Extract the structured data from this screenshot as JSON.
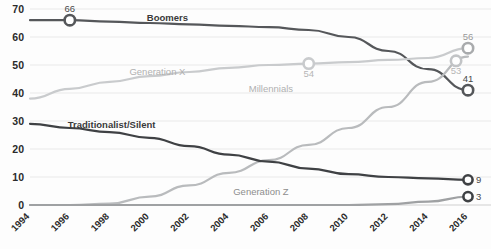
{
  "chart_data": {
    "type": "line",
    "title": "",
    "xlabel": "",
    "ylabel": "",
    "xlim": [
      1994,
      2016
    ],
    "ylim": [
      0,
      70
    ],
    "grid": true,
    "legend": "inline-labels",
    "x": [
      1994,
      1996,
      1998,
      2000,
      2002,
      2004,
      2006,
      2008,
      2010,
      2012,
      2014,
      2016
    ],
    "yticks": [
      "0",
      "10",
      "20",
      "30",
      "40",
      "50",
      "60",
      "70"
    ],
    "xticks": [
      "1994",
      "1996",
      "1998",
      "2000",
      "2002",
      "2004",
      "2006",
      "2008",
      "2010",
      "2012",
      "2014",
      "2016"
    ],
    "series": [
      {
        "name": "Boomers",
        "color": "#55575a",
        "label_x": 2000.9,
        "label_y": 65.6,
        "values": [
          66,
          66,
          65.5,
          65,
          64.5,
          64,
          63.5,
          62.5,
          60,
          55,
          48.5,
          41
        ]
      },
      {
        "name": "Generation X",
        "color": "#c9cbcd",
        "label_x": 2000.4,
        "label_y": 46.5,
        "values": [
          38,
          41.5,
          44,
          46,
          47.5,
          49,
          50,
          50.5,
          51,
          51.8,
          52.5,
          56
        ]
      },
      {
        "name": "Millennials",
        "color": "#b9bbbd",
        "label_x": 2006.1,
        "label_y": 40.5,
        "values": [
          0,
          0,
          0.5,
          3,
          7,
          11.5,
          16,
          21.5,
          27.5,
          35,
          44,
          53
        ]
      },
      {
        "name": "Traditionalist/Silent",
        "color": "#3f4144",
        "label_x": 1998.1,
        "label_y": 27.5,
        "values": [
          29,
          27.5,
          26,
          24,
          21,
          18,
          15.5,
          13,
          11,
          10,
          9.5,
          9
        ]
      },
      {
        "name": "Generation Z",
        "color": "#9fa1a3",
        "label_x": 2005.6,
        "label_y": 3.6,
        "values": [
          0,
          0,
          0,
          0,
          0,
          0,
          0,
          0,
          0,
          0.3,
          1.2,
          3
        ]
      }
    ],
    "markers": [
      {
        "series": "Boomers",
        "x": 1996,
        "y": 66,
        "label": "66",
        "label_pos": "above",
        "color": "#55575a",
        "tone": "dark"
      },
      {
        "series": "Boomers",
        "x": 2016,
        "y": 41,
        "label": "41",
        "label_pos": "above",
        "color": "#55575a",
        "tone": "dark"
      },
      {
        "series": "Generation X",
        "x": 2008,
        "y": 50.5,
        "label": "54",
        "label_pos": "below",
        "color": "#c9cbcd",
        "tone": "light"
      },
      {
        "series": "Generation X",
        "x": 2016,
        "y": 56,
        "label": "56",
        "label_pos": "above",
        "color": "#a9abad",
        "tone": "mid"
      },
      {
        "series": "Millennials",
        "x": 2015.4,
        "y": 51.5,
        "label": "53",
        "label_pos": "below",
        "color": "#c2c4c6",
        "tone": "light"
      },
      {
        "series": "Traditionalist/Silent",
        "x": 2016,
        "y": 9,
        "label": "9",
        "label_pos": "right",
        "color": "#3f4144",
        "tone": "dark"
      },
      {
        "series": "Generation Z",
        "x": 2016,
        "y": 3,
        "label": "3",
        "label_pos": "right",
        "color": "#3f4144",
        "tone": "dark"
      }
    ]
  }
}
